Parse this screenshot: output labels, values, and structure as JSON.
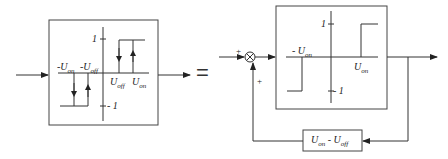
{
  "left_block": {
    "y_top": "1",
    "y_bottom": "- 1",
    "neg_on": "-U",
    "neg_on_sub": "on",
    "neg_off": "-U",
    "neg_off_sub": "off",
    "pos_off": "U",
    "pos_off_sub": "off",
    "pos_on": "U",
    "pos_on_sub": "on"
  },
  "equals": "=",
  "right_block": {
    "summing_plus_top": "+",
    "summing_plus_bottom": "+",
    "relay": {
      "y_top": "1",
      "y_bottom": "- 1",
      "neg_on": "- U",
      "neg_on_sub": "on",
      "pos_on": "U",
      "pos_on_sub": "on"
    },
    "feedback": {
      "a": "U",
      "a_sub": "on",
      "minus": " - ",
      "b": "U",
      "b_sub": "off"
    }
  }
}
